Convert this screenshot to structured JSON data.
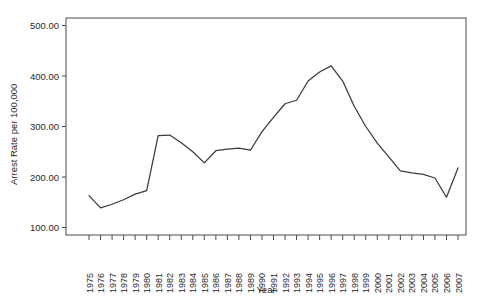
{
  "chart_data": {
    "type": "line",
    "title": "",
    "xlabel": "Year",
    "ylabel": "Arrest Rate per 100,000",
    "xlim": [
      1975,
      2007
    ],
    "ylim": [
      100,
      500
    ],
    "grid": false,
    "legend": "none",
    "y_ticks": [
      100,
      200,
      300,
      400,
      500
    ],
    "y_tick_labels": [
      "100.00",
      "200.00",
      "300.00",
      "400.00",
      "500.00"
    ],
    "categories": [
      "1975",
      "1976",
      "1977",
      "1978",
      "1979",
      "1980",
      "1981",
      "1982",
      "1983",
      "1984",
      "1985",
      "1986",
      "1987",
      "1988",
      "1989",
      "1990",
      "1991",
      "1992",
      "1993",
      "1994",
      "1995",
      "1996",
      "1997",
      "1998",
      "1999",
      "2000",
      "2001",
      "2002",
      "2003",
      "2004",
      "2005",
      "2006",
      "2007"
    ],
    "values": [
      163,
      139,
      146,
      155,
      166,
      173,
      282,
      283,
      268,
      250,
      228,
      252,
      255,
      257,
      253,
      290,
      318,
      345,
      352,
      390,
      408,
      420,
      390,
      340,
      300,
      267,
      240,
      212,
      208,
      205,
      198,
      160,
      218
    ],
    "series": [
      {
        "name": "Arrest Rate",
        "values": [
          163,
          139,
          146,
          155,
          166,
          173,
          282,
          283,
          268,
          250,
          228,
          252,
          255,
          257,
          253,
          290,
          318,
          345,
          352,
          390,
          408,
          420,
          390,
          340,
          300,
          267,
          240,
          212,
          208,
          205,
          198,
          160,
          218
        ]
      }
    ]
  },
  "axes": {
    "y_title": "Arrest Rate per 100,000",
    "x_title": "Year"
  }
}
